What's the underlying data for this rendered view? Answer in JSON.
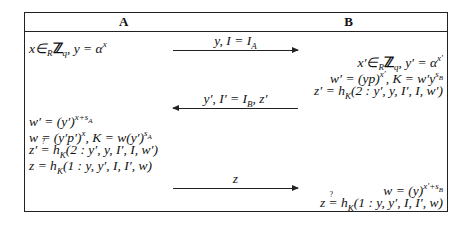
{
  "figure": {
    "type": "protocol-diagram",
    "parties": {
      "left": "A",
      "right": "B"
    },
    "steps": [
      {
        "side": "A",
        "text": "x∈_R ℤ_q, y = α^x"
      },
      {
        "message": "y, I = I_A",
        "direction": "A→B"
      },
      {
        "side": "B",
        "text": "x′∈_R ℤ_q, y′ = α^{x′}"
      },
      {
        "side": "B",
        "text": "w′ = (yp)^{x′}, K = w′y^{s_B}"
      },
      {
        "side": "B",
        "text": "z′ = h_K(2 : y′, y, I′, I, w′)"
      },
      {
        "message": "y′, I′ = I_B, z′",
        "direction": "B→A"
      },
      {
        "side": "A",
        "text": "w′ = (y′)^{x+s_A}"
      },
      {
        "side": "A",
        "text": "w = (y′p′)^x, K = w(y′)^{s_A}"
      },
      {
        "side": "A",
        "text": "z′ ≟ h_K(2 : y′, y, I′, I, w′)"
      },
      {
        "side": "A",
        "text": "z = h_K(1 : y, y′, I, I′, w)"
      },
      {
        "message": "z",
        "direction": "A→B"
      },
      {
        "side": "B",
        "text": "w = (y)^{x′+s_B}"
      },
      {
        "side": "B",
        "text": "z ≟ h_K(1 : y, y′, I, I′, w)"
      }
    ]
  },
  "labels": {
    "header_a": "A",
    "header_b": "B",
    "a1": "x∈ℤ, y = α",
    "msg1": "y, I = I",
    "msg2": "y′, I′ = I, z′",
    "msg3": "z"
  }
}
